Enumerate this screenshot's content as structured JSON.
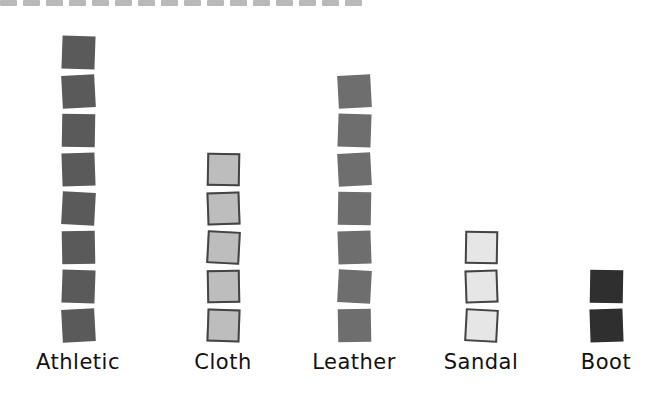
{
  "chart_data": {
    "type": "bar",
    "style": "pictograph",
    "title": "",
    "xlabel": "",
    "ylabel": "",
    "categories": [
      "Athletic",
      "Cloth",
      "Leather",
      "Sandal",
      "Boot"
    ],
    "values": [
      8,
      5,
      7,
      3,
      2
    ],
    "unit_icon": "square-tile",
    "grid": false,
    "legend": null,
    "colors": [
      "#5a5a5a",
      "#bdbdbd",
      "#6e6e6e",
      "#e6e6e6",
      "#2f2f2f"
    ]
  },
  "columns": [
    {
      "label": "Athletic",
      "count": 8,
      "style": "dark",
      "x": 78
    },
    {
      "label": "Cloth",
      "count": 5,
      "style": "light",
      "x": 223
    },
    {
      "label": "Leather",
      "count": 7,
      "style": "mid",
      "x": 354
    },
    {
      "label": "Sandal",
      "count": 3,
      "style": "pale",
      "x": 481
    },
    {
      "label": "Boot",
      "count": 2,
      "style": "black",
      "x": 606
    }
  ]
}
